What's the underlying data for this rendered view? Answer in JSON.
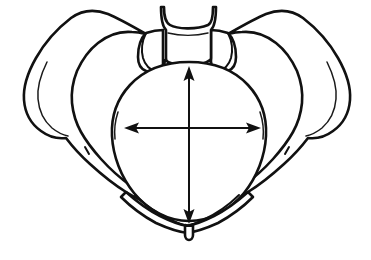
{
  "figure": {
    "title": "Pelvic inlet with anteroposterior and transverse diameter arrows",
    "style": "black-and-white line drawing",
    "background_color": "#ffffff",
    "line_color": "#111111",
    "width_px": 371,
    "height_px": 260,
    "caption": "",
    "labels": []
  },
  "anatomy": {
    "parts": [
      {
        "id": "sacrum",
        "name": "Sacrum / sacral promontory",
        "position": "top center"
      },
      {
        "id": "sacral-ala-left",
        "name": "Left sacral ala",
        "position": "top center-left"
      },
      {
        "id": "sacral-ala-right",
        "name": "Right sacral ala",
        "position": "top center-right"
      },
      {
        "id": "ilium-left",
        "name": "Left ilium (iliac wing / crest)",
        "position": "upper left"
      },
      {
        "id": "ilium-right",
        "name": "Right ilium (iliac wing / crest)",
        "position": "upper right"
      },
      {
        "id": "asis-left",
        "name": "Left anterior superior iliac spine",
        "position": "left"
      },
      {
        "id": "asis-right",
        "name": "Right anterior superior iliac spine",
        "position": "right"
      },
      {
        "id": "pubis-left",
        "name": "Left superior pubic ramus",
        "position": "lower left"
      },
      {
        "id": "pubis-right",
        "name": "Right superior pubic ramus",
        "position": "lower right"
      },
      {
        "id": "pubic-symphysis",
        "name": "Pubic symphysis",
        "position": "bottom center"
      },
      {
        "id": "pelvic-inlet",
        "name": "Pelvic inlet (pelvic brim)",
        "position": "center"
      }
    ]
  },
  "measurements": {
    "vertical": {
      "id": "anteroposterior-diameter",
      "name": "Anteroposterior (conjugate) diameter",
      "label": "",
      "orientation": "vertical",
      "arrowheads": "both",
      "x": 189,
      "y_top": 68,
      "y_bottom": 222,
      "color": "#111111"
    },
    "horizontal": {
      "id": "transverse-diameter",
      "name": "Transverse diameter",
      "label": "",
      "orientation": "horizontal",
      "arrowheads": "both",
      "y": 128,
      "x_left": 126,
      "x_right": 259,
      "color": "#111111"
    }
  }
}
